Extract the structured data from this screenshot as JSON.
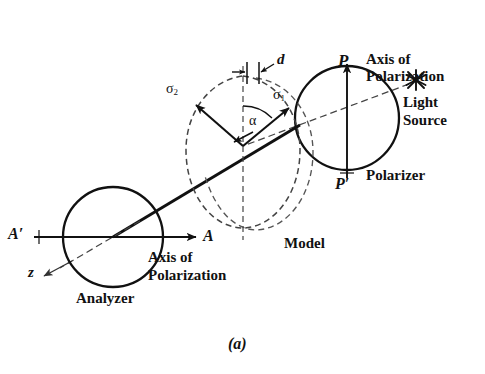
{
  "figure": {
    "caption": "(a)"
  },
  "colors": {
    "ink": "#111111",
    "background": "#ffffff",
    "dashed": "#333333"
  },
  "labels": {
    "p_top": "P",
    "p_bottom": "P′",
    "axis_of_polarization_top_line1": "Axis of",
    "axis_of_polarization_top_line2": "Polarization",
    "light_source_line1": "Light",
    "light_source_line2": "Source",
    "polarizer": "Polarizer",
    "model": "Model",
    "analyzer": "Analyzer",
    "a_right": "A",
    "a_left": "A′",
    "z_axis": "z",
    "axis_of_polarization_bottom_line1": "Axis of",
    "axis_of_polarization_bottom_line2": "Polarization",
    "sigma1": "σ",
    "sigma1_sub": "1",
    "sigma2": "σ",
    "sigma2_sub": "2",
    "alpha": "α",
    "thickness": "d"
  },
  "icons": {
    "light_source": "asterisk-star-icon",
    "polarizer_disc": "circle-icon",
    "analyzer_disc": "circle-icon",
    "model_outline": "dashed-teardrop-icon"
  },
  "geometry": {
    "polarizer": {
      "cx": 347,
      "cy": 118,
      "r": 52
    },
    "analyzer": {
      "cx": 113,
      "cy": 237,
      "r": 50
    },
    "model_center": {
      "x": 243,
      "y": 146
    },
    "light_source": {
      "x": 416,
      "y": 80
    },
    "polarization_axis_p": {
      "x1": 347,
      "y1": 60,
      "x2": 347,
      "y2": 180
    },
    "polarization_axis_a": {
      "x1": 40,
      "y1": 237,
      "x2": 210,
      "y2": 237
    },
    "light_ray": {
      "x1": 410,
      "y1": 84,
      "x2": 45,
      "y2": 272
    },
    "alpha_degrees": 38
  }
}
